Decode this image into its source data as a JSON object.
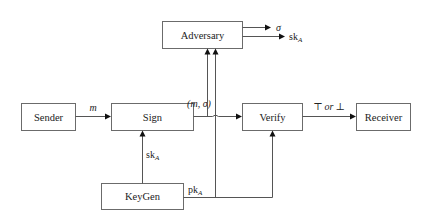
{
  "diagram": {
    "nodes": {
      "adversary": "Adversary",
      "sender": "Sender",
      "sign": "Sign",
      "verify": "Verify",
      "receiver": "Receiver",
      "keygen": "KeyGen"
    },
    "edges": {
      "sender_to_sign": "m",
      "sign_output": "(m, σ)",
      "verify_output": "⊤ or ⊥",
      "verify_output_top": "⊤",
      "verify_output_or": "or",
      "verify_output_bot": "⊥",
      "adversary_out_sigma": "σ",
      "adversary_out_sk_main": "sk",
      "adversary_out_sk_sub": "A",
      "keygen_to_sign_main": "sk",
      "keygen_to_sign_sub": "A",
      "keygen_pk_main": "pk",
      "keygen_pk_sub": "A"
    }
  }
}
